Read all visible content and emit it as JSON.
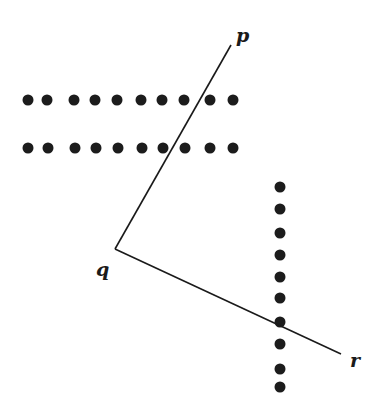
{
  "diagram": {
    "title": "",
    "colors": {
      "ink": "#1a1a1a",
      "dot": "#1c1c1c",
      "background": "#ffffff"
    },
    "vertex": {
      "label": "q",
      "x": 115,
      "y": 249,
      "label_x": 96,
      "label_y": 276
    },
    "rays": [
      {
        "label": "p",
        "x1": 115,
        "y1": 249,
        "x2": 231,
        "y2": 45,
        "label_x": 236,
        "label_y": 42
      },
      {
        "label": "r",
        "x1": 115,
        "y1": 249,
        "x2": 341,
        "y2": 354,
        "label_x": 350,
        "label_y": 367
      }
    ],
    "dot_rows": [
      {
        "name": "row-1",
        "y": 100,
        "xs": [
          28,
          47,
          74,
          95,
          117,
          141,
          162,
          184,
          210,
          233
        ]
      },
      {
        "name": "row-2",
        "y": 148,
        "xs": [
          28,
          48,
          75,
          96,
          118,
          142,
          163,
          185,
          210,
          233
        ]
      }
    ],
    "dot_columns": [
      {
        "name": "column-1",
        "x": 280,
        "ys": [
          187,
          209,
          233,
          255,
          277,
          298,
          322,
          344,
          369,
          387
        ]
      }
    ],
    "dot_radius": 5.5
  }
}
